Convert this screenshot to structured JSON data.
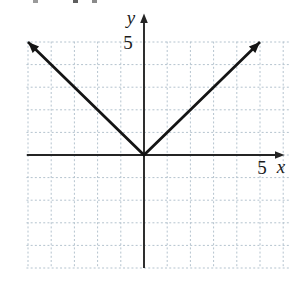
{
  "figure": {
    "background": "#ffffff"
  },
  "chart_data": {
    "type": "line",
    "title": "",
    "xlabel": "x",
    "ylabel": "y",
    "x_tick_labels": [
      {
        "value": 5,
        "label": "5"
      }
    ],
    "y_tick_labels": [
      {
        "value": 5,
        "label": "5"
      }
    ],
    "xlim": [
      -5.05,
      6.3
    ],
    "ylim": [
      -5,
      5.6
    ],
    "grid": {
      "style": "dotted",
      "x_range": [
        -5,
        6
      ],
      "y_range": [
        -5,
        5
      ],
      "color": "#b4c3ce"
    },
    "axes": {
      "color": "#242424",
      "x_axis": {
        "arrow": "right"
      },
      "y_axis": {
        "arrow": "up"
      }
    },
    "series": [
      {
        "name": "absolute-value-curve",
        "points": [
          [
            -5,
            5
          ],
          [
            0,
            0
          ],
          [
            5,
            5
          ]
        ],
        "arrows": "both",
        "color": "#141414",
        "width": 2.7
      }
    ]
  }
}
